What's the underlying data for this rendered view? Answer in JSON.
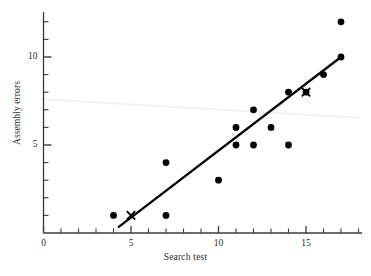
{
  "chart_data": {
    "type": "scatter",
    "title": "",
    "xlabel": "Search test",
    "ylabel": "Assembly errors",
    "xlim": [
      0,
      18
    ],
    "ylim": [
      0,
      12.7
    ],
    "grid": false,
    "legend": "none",
    "x_ticks_major": [
      0,
      5,
      10,
      15
    ],
    "x_tick_labels": [
      "0",
      "5",
      "10",
      "15"
    ],
    "x_ticks_minor": [
      1,
      2,
      3,
      4,
      6,
      7,
      8,
      9,
      11,
      12,
      13,
      14,
      16,
      17,
      18
    ],
    "y_ticks_major": [
      5,
      10
    ],
    "y_tick_labels": [
      "5",
      "10"
    ],
    "y_ticks_minor": [
      1,
      2,
      3,
      4,
      6,
      7,
      8,
      9,
      11,
      12
    ],
    "points": [
      {
        "x": 4,
        "y": 1
      },
      {
        "x": 7,
        "y": 1
      },
      {
        "x": 7,
        "y": 4
      },
      {
        "x": 10,
        "y": 3
      },
      {
        "x": 11,
        "y": 5
      },
      {
        "x": 11,
        "y": 6
      },
      {
        "x": 12,
        "y": 5
      },
      {
        "x": 12,
        "y": 7
      },
      {
        "x": 13,
        "y": 6
      },
      {
        "x": 14,
        "y": 5
      },
      {
        "x": 14,
        "y": 8
      },
      {
        "x": 15,
        "y": 8
      },
      {
        "x": 16,
        "y": 9
      },
      {
        "x": 17,
        "y": 10
      },
      {
        "x": 17,
        "y": 12
      }
    ],
    "cross_markers": [
      {
        "x": 5,
        "y": 1
      },
      {
        "x": 15,
        "y": 8
      }
    ],
    "fit_line": {
      "label": "regression line",
      "x_start": 4.3,
      "y_start": 0.35,
      "x_end": 17.0,
      "y_end": 10.0
    },
    "artifact_line": {
      "label": "scan-artifact-streak",
      "x_start": 0.0,
      "y_start": 7.6,
      "x_end": 18.0,
      "y_end": 6.55,
      "color": "#eeeeea"
    },
    "marker_color": "#000000",
    "line_color": "#000000",
    "axis_color": "#3a3a3a"
  }
}
